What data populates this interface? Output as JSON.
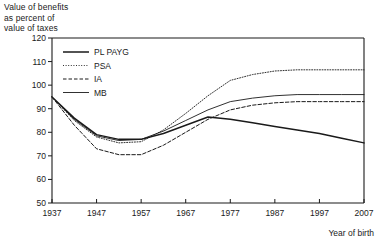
{
  "axis_title": {
    "line1": "Value of benefits",
    "line2": "as percent of",
    "line3": "value of taxes"
  },
  "xlabel": "Year of birth",
  "legend": {
    "entries": [
      {
        "label": "PL PAYG",
        "style": "solid-thick",
        "color": "#1a1a1a"
      },
      {
        "label": "PSA",
        "style": "dotted",
        "color": "#3a3a3a"
      },
      {
        "label": "IA",
        "style": "dashed",
        "color": "#2a2a2a"
      },
      {
        "label": "MB",
        "style": "solid-thin",
        "color": "#444444"
      }
    ]
  },
  "yticks": [
    "120",
    "110",
    "100",
    "90",
    "80",
    "70",
    "60",
    "50"
  ],
  "xticks": [
    "1937",
    "1947",
    "1957",
    "1967",
    "1977",
    "1987",
    "1997",
    "2007"
  ],
  "chart_data": {
    "type": "line",
    "title": "Value of benefits as percent of value of taxes",
    "xlabel": "Year of birth",
    "ylabel": "Value of benefits as percent of value of taxes",
    "xlim": [
      1937,
      2007
    ],
    "ylim": [
      50,
      120
    ],
    "grid": false,
    "legend_position": "upper-left-inside",
    "x": [
      1937,
      1942,
      1947,
      1952,
      1957,
      1962,
      1967,
      1972,
      1977,
      1982,
      1987,
      1992,
      1997,
      2002,
      2007
    ],
    "series": [
      {
        "name": "PL PAYG",
        "style": "solid-thick",
        "values": [
          95,
          86,
          79,
          77,
          77,
          79.5,
          83,
          86.5,
          85.5,
          84,
          82.5,
          81,
          79.5,
          77.5,
          75.5
        ]
      },
      {
        "name": "PSA",
        "style": "dotted",
        "values": [
          95,
          85,
          78,
          75.5,
          76,
          81,
          88,
          95.5,
          102,
          104.5,
          106,
          106.5,
          106.5,
          106.5,
          106.5
        ]
      },
      {
        "name": "IA",
        "style": "dashed",
        "values": [
          95,
          83,
          73,
          70.5,
          70.5,
          74.5,
          80,
          85.5,
          89.5,
          91.5,
          92.5,
          93,
          93,
          93,
          93
        ]
      },
      {
        "name": "MB",
        "style": "solid-thin",
        "values": [
          95,
          85.5,
          78.5,
          76.5,
          77,
          80.5,
          85,
          89.5,
          93,
          94.5,
          95.5,
          96,
          96,
          96,
          96
        ]
      }
    ]
  }
}
